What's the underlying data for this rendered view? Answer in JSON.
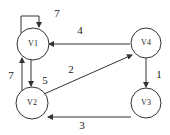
{
  "graph": {
    "nodes": [
      {
        "id": "V1",
        "label": "V1"
      },
      {
        "id": "V2",
        "label": "V2"
      },
      {
        "id": "V3",
        "label": "V3"
      },
      {
        "id": "V4",
        "label": "V4"
      }
    ],
    "edges": [
      {
        "from": "V1",
        "to": "V1",
        "weight": "7"
      },
      {
        "from": "V4",
        "to": "V1",
        "weight": "4"
      },
      {
        "from": "V2",
        "to": "V4",
        "weight": "2"
      },
      {
        "from": "V1",
        "to": "V2",
        "weight": "5"
      },
      {
        "from": "V2",
        "to": "V1",
        "weight": "7"
      },
      {
        "from": "V4",
        "to": "V3",
        "weight": "1"
      },
      {
        "from": "V3",
        "to": "V2",
        "weight": "3"
      }
    ]
  },
  "colors": {
    "stroke": "#333333",
    "background": "#ffffff"
  }
}
